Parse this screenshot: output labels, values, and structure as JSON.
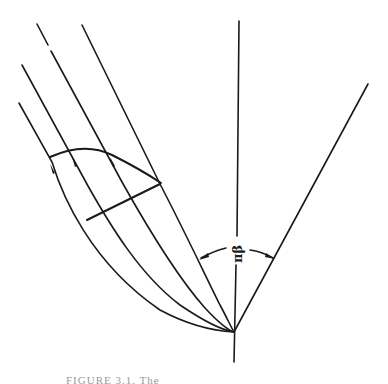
{
  "figure": {
    "angle_label": "πβ",
    "caption": "FIGURE 3.1. The"
  },
  "colors": {
    "ink": "#1a1a1a",
    "background": "#ffffff",
    "caption": "#9a9a9a"
  }
}
